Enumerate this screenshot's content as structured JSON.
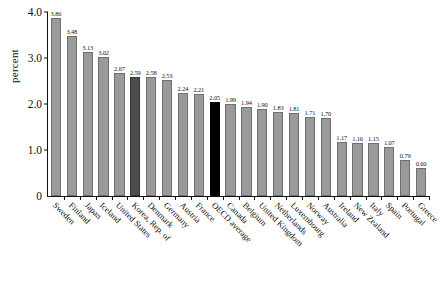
{
  "chart_data": {
    "type": "bar",
    "title": "",
    "xlabel": "",
    "ylabel": "percent",
    "ylim": [
      0,
      4.0
    ],
    "grid": false,
    "legend": null,
    "ytick_labels": [
      "0",
      "1.0",
      "2.0",
      "3.0",
      "4.0"
    ],
    "ytick_values": [
      0,
      1.0,
      2.0,
      3.0,
      4.0
    ],
    "categories": [
      "Sweden",
      "Finland",
      "Japan",
      "Iceland",
      "United States",
      "Korea, Rep. of",
      "Denmark",
      "Germany",
      "Austria",
      "France",
      "OECD average",
      "Canada",
      "Belgium",
      "United Kingdom",
      "Netherlands",
      "Luxembourg",
      "Norway",
      "Australia",
      "Ireland",
      "New Zealand",
      "Italy",
      "Spain",
      "Portugal",
      "Greece"
    ],
    "values": [
      3.86,
      3.48,
      3.13,
      3.02,
      2.67,
      2.59,
      2.58,
      2.53,
      2.24,
      2.21,
      2.05,
      1.99,
      1.94,
      1.9,
      1.83,
      1.81,
      1.71,
      1.7,
      1.17,
      1.16,
      1.15,
      1.07,
      0.79,
      0.6
    ],
    "value_labels": [
      "3.86",
      "3.48",
      "3.13",
      "3.02",
      "2.67",
      "2.59",
      "2.58",
      "2.53",
      "2.24",
      "2.21",
      "2.05",
      "1.99",
      "1.94",
      "1.90",
      "1.83",
      "1.81",
      "1.71",
      "1.70",
      "1.17",
      "1.16",
      "1.15",
      "1.07",
      "0.79",
      "0.60"
    ],
    "bar_styles": [
      "normal",
      "normal",
      "normal",
      "normal",
      "normal",
      "dark",
      "normal",
      "normal",
      "normal",
      "normal",
      "black",
      "normal",
      "normal",
      "normal",
      "normal",
      "normal",
      "normal",
      "normal",
      "normal",
      "normal",
      "normal",
      "normal",
      "normal",
      "normal"
    ],
    "colors": {
      "bar_normal": "#9a9a9a",
      "bar_highlight_dark": "#4d4d4d",
      "bar_highlight_black": "#000000",
      "axis": "#111111",
      "background": "#ffffff",
      "text": "#111111"
    }
  }
}
